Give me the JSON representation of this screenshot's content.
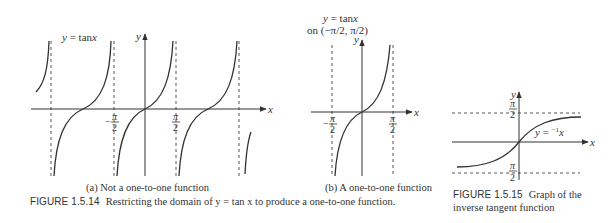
{
  "figure_1_5_14": {
    "panel_a": {
      "curve_label": "y = tan x",
      "y_axis_label": "y",
      "x_axis_label": "x",
      "tick_labels": [
        {
          "num": "π",
          "den": "2",
          "sign": "−",
          "x_value": "-π/2"
        },
        {
          "num": "π",
          "den": "2",
          "sign": "",
          "x_value": "π/2"
        }
      ],
      "caption": "(a) Not a one-to-one function"
    },
    "panel_b": {
      "title_line1": "y = tan x",
      "title_line2": "on (−π/2, π/2)",
      "y_axis_label": "y",
      "x_axis_label": "x",
      "tick_labels": [
        {
          "num": "π",
          "den": "2",
          "sign": "−",
          "x_value": "-π/2"
        },
        {
          "num": "π",
          "den": "2",
          "sign": "",
          "x_value": "π/2"
        }
      ],
      "caption": "(b) A one-to-one function"
    },
    "figure_number": "FIGURE 1.5.14",
    "figure_caption": "Restricting the domain of y = tan x to produce a one-to-one function."
  },
  "figure_1_5_15": {
    "curve_label": "y = tan",
    "curve_label_sup": "−1",
    "curve_label_var": "x",
    "y_axis_label": "y",
    "x_axis_label": "x",
    "tick_labels": [
      {
        "num": "π",
        "den": "2",
        "y_value": "π/2"
      },
      {
        "num": "π",
        "den": "2",
        "y_value": "-π/2"
      }
    ],
    "figure_number": "FIGURE 1.5.15",
    "figure_caption_line1": "Graph of the",
    "figure_caption_line2": "inverse tangent function"
  },
  "colors": {
    "ink": "#333333",
    "background": "#ffffff"
  }
}
